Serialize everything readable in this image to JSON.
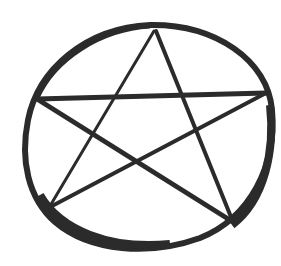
{
  "image": {
    "subject": "hand-drawn pentagram inside a circle",
    "colors": {
      "background": "#ffffff",
      "ink": "#2b2b2b"
    },
    "circle": {
      "cx": 148,
      "cy": 137,
      "rx": 122,
      "ry": 110
    },
    "star_vertices": {
      "top": [
        154,
        31
      ],
      "left": [
        37,
        99
      ],
      "right": [
        266,
        93
      ],
      "bottom_left": [
        50,
        206
      ],
      "bottom_right": [
        233,
        222
      ]
    }
  }
}
